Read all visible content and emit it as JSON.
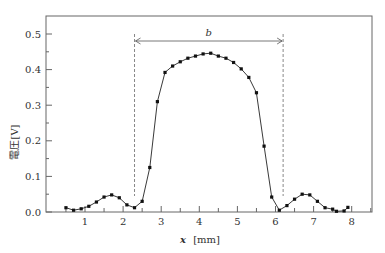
{
  "chart_data": {
    "type": "line",
    "title": "",
    "xlabel": "x [mm]",
    "xlabel_var": "x",
    "xlabel_unit": "[mm]",
    "ylabel": "電圧[V]",
    "xlim": [
      0,
      8.6
    ],
    "ylim": [
      0,
      0.55
    ],
    "x_ticks": [
      1,
      2,
      3,
      4,
      5,
      6,
      7,
      8
    ],
    "y_ticks": [
      "0.0",
      "0.1",
      "0.2",
      "0.3",
      "0.4",
      "0.5"
    ],
    "grid": false,
    "legend": null,
    "annotation": {
      "label": "b",
      "x_start": 2.3,
      "x_end": 6.2,
      "y": 0.48,
      "style": "double-arrow with dashed vertical guide lines"
    },
    "series": [
      {
        "name": "voltage",
        "x": [
          0.5,
          0.7,
          0.9,
          1.1,
          1.3,
          1.5,
          1.7,
          1.9,
          2.1,
          2.3,
          2.5,
          2.7,
          2.9,
          3.1,
          3.3,
          3.5,
          3.7,
          3.9,
          4.1,
          4.3,
          4.5,
          4.7,
          4.9,
          5.1,
          5.3,
          5.5,
          5.7,
          5.9,
          6.1,
          6.3,
          6.5,
          6.7,
          6.9,
          7.1,
          7.3,
          7.5,
          7.6,
          7.8,
          7.9
        ],
        "values": [
          0.012,
          0.005,
          0.009,
          0.016,
          0.028,
          0.042,
          0.048,
          0.04,
          0.02,
          0.012,
          0.03,
          0.125,
          0.31,
          0.392,
          0.41,
          0.422,
          0.432,
          0.438,
          0.444,
          0.446,
          0.438,
          0.432,
          0.42,
          0.402,
          0.378,
          0.335,
          0.185,
          0.042,
          0.005,
          0.018,
          0.036,
          0.05,
          0.048,
          0.03,
          0.012,
          0.008,
          0.002,
          0.003,
          0.013
        ]
      }
    ]
  }
}
